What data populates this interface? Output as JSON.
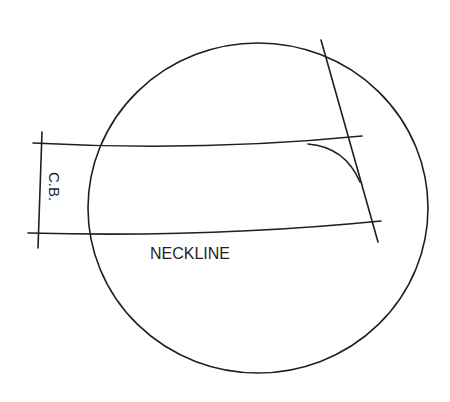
{
  "diagram": {
    "type": "pattern-drafting-neckline",
    "labels": {
      "center_back": "C.B.",
      "neckline": "NECKLINE"
    },
    "colors": {
      "background": "#ffffff",
      "line": "#1f1f1f"
    },
    "shapes": {
      "circle": {
        "cx": 258,
        "cy": 208,
        "rx": 170,
        "ry": 165
      },
      "upper_line": "M33,143 Q200,152 362,136",
      "lower_line": "M28,233 Q210,238 381,221",
      "center_back_line": "M42,132 L38,248",
      "diagonal_line": "M321,40 L378,242",
      "corner_curve": "M308,144 Q345,147 360,182"
    }
  }
}
